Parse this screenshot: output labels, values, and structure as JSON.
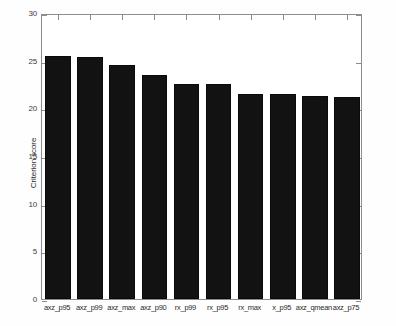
{
  "chart_data": {
    "type": "bar",
    "title": "",
    "xlabel": "",
    "ylabel": "Criterion score",
    "categories": [
      "axz_p95",
      "axz_p99",
      "axz_max",
      "axz_p90",
      "rx_p99",
      "rx_p95",
      "rx_max",
      "x_p95",
      "axz_qmean",
      "axz_p75"
    ],
    "values": [
      25.5,
      25.4,
      24.5,
      23.5,
      22.6,
      22.6,
      21.5,
      21.5,
      21.3,
      21.2
    ],
    "ylim": [
      0,
      30
    ],
    "yticks": [
      0,
      5,
      10,
      15,
      20,
      25,
      30
    ],
    "ytick_labels": [
      "0",
      "5",
      "10",
      "15",
      "20",
      "25",
      "30"
    ],
    "grid": false,
    "legend": null,
    "bar_color": "#121212",
    "axis_color": "#8d8d8d",
    "series": [
      {
        "name": "Criterion score",
        "values": [
          25.5,
          25.4,
          24.5,
          23.5,
          22.6,
          22.6,
          21.5,
          21.5,
          21.3,
          21.2
        ]
      }
    ]
  }
}
